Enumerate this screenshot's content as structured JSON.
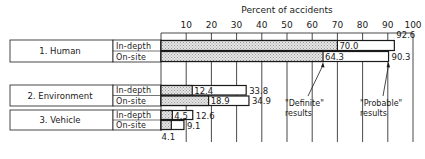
{
  "chart_data": {
    "type": "bar",
    "orientation": "horizontal",
    "title": "",
    "xlabel": "Percent of accidents",
    "ylabel": "",
    "xlim": [
      0,
      100
    ],
    "xticks": [
      10,
      20,
      30,
      40,
      50,
      60,
      70,
      80,
      90,
      100
    ],
    "grid": "vertical lines at each tick",
    "legend": null,
    "categories": [
      "1. Human",
      "2. Environment",
      "3. Vehicle"
    ],
    "subcategories": [
      "In-depth",
      "On-site"
    ],
    "series": [
      {
        "name": "\"Definite\" results",
        "style": "stippled (hatched) fill",
        "values": {
          "1. Human": {
            "In-depth": 70.0,
            "On-site": 64.3
          },
          "2. Environment": {
            "In-depth": 12.4,
            "On-site": 18.9
          },
          "3. Vehicle": {
            "In-depth": 4.5,
            "On-site": 4.1
          }
        }
      },
      {
        "name": "\"Probable\" results",
        "style": "open (white) bar extending beyond definite",
        "values": {
          "1. Human": {
            "In-depth": 92.6,
            "On-site": 90.3
          },
          "2. Environment": {
            "In-depth": 33.8,
            "On-site": 34.9
          },
          "3. Vehicle": {
            "In-depth": 12.6,
            "On-site": 9.1
          }
        }
      }
    ],
    "annotations": [
      {
        "text": "\"Definite\" results",
        "points_to": "1. Human On-site definite bar end (64.3)"
      },
      {
        "text": "\"Probable\" results",
        "points_to": "1. Human On-site probable bar end (90.3)"
      }
    ],
    "value_labels": [
      {
        "category": "1. Human",
        "sub": "In-depth",
        "definite": "70.0",
        "probable": "92.6"
      },
      {
        "category": "1. Human",
        "sub": "On-site",
        "definite": "64.3",
        "probable": "90.3"
      },
      {
        "category": "2. Environment",
        "sub": "In-depth",
        "definite": "12.4",
        "probable": "33.8"
      },
      {
        "category": "2. Environment",
        "sub": "On-site",
        "definite": "18.9",
        "probable": "34.9"
      },
      {
        "category": "3. Vehicle",
        "sub": "In-depth",
        "definite": "4.5",
        "probable": "12.6"
      },
      {
        "category": "3. Vehicle",
        "sub": "On-site",
        "definite": "4.1",
        "probable": "9.1"
      }
    ]
  },
  "axis": {
    "title": "Percent of accidents",
    "ticks": [
      "10",
      "20",
      "30",
      "40",
      "50",
      "60",
      "70",
      "80",
      "90",
      "100"
    ]
  },
  "groups": [
    {
      "label": "1. Human",
      "rows": [
        {
          "sub": "In-depth",
          "definite": 70.0,
          "probable": 92.6,
          "definite_label": "70.0",
          "probable_label": "92.6"
        },
        {
          "sub": "On-site",
          "definite": 64.3,
          "probable": 90.3,
          "definite_label": "64.3",
          "probable_label": "90.3"
        }
      ]
    },
    {
      "label": "2. Environment",
      "rows": [
        {
          "sub": "In-depth",
          "definite": 12.4,
          "probable": 33.8,
          "definite_label": "12.4",
          "probable_label": "33.8"
        },
        {
          "sub": "On-site",
          "definite": 18.9,
          "probable": 34.9,
          "definite_label": "18.9",
          "probable_label": "34.9"
        }
      ]
    },
    {
      "label": "3. Vehicle",
      "rows": [
        {
          "sub": "In-depth",
          "definite": 4.5,
          "probable": 12.6,
          "definite_label": "4.5",
          "probable_label": "12.6"
        },
        {
          "sub": "On-site",
          "definite": 4.1,
          "probable": 9.1,
          "definite_label": "4.1",
          "probable_label": "9.1"
        }
      ]
    }
  ],
  "annotations": {
    "definite": [
      "\"Definite\"",
      "results"
    ],
    "probable": [
      "\"Probable\"",
      "results"
    ]
  },
  "colors": {
    "ink": "#1a1a1a",
    "stipple": "#c8c8c8",
    "background": "#ffffff"
  }
}
